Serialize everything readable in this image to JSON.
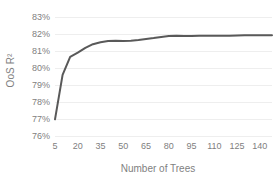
{
  "chart_data": {
    "type": "line",
    "title": "",
    "xlabel": "Number of Trees",
    "ylabel": "OoS R²",
    "xlim": [
      5,
      148
    ],
    "ylim": [
      0.76,
      0.83
    ],
    "ytick_format": "percent",
    "grid": true,
    "legend": "none",
    "series_color": "#595959",
    "gridline_color": "#eeeeee",
    "tick_label_color": "#808080",
    "axis_title_color": "#7f7f7f",
    "background": "#ffffff",
    "xticks": [
      5,
      20,
      35,
      50,
      65,
      80,
      95,
      110,
      125,
      140
    ],
    "xtick_labels": [
      "5",
      "20",
      "35",
      "50",
      "65",
      "80",
      "95",
      "110",
      "125",
      "140"
    ],
    "yticks": [
      0.76,
      0.77,
      0.78,
      0.79,
      0.8,
      0.81,
      0.82,
      0.83
    ],
    "ytick_labels": [
      "76%",
      "77%",
      "78%",
      "79%",
      "80%",
      "81%",
      "82%",
      "83%"
    ],
    "x": [
      5,
      10,
      15,
      20,
      25,
      30,
      35,
      40,
      45,
      50,
      55,
      60,
      65,
      70,
      75,
      80,
      85,
      90,
      95,
      100,
      105,
      110,
      115,
      120,
      125,
      130,
      135,
      140,
      145,
      148
    ],
    "values": [
      0.7698,
      0.796,
      0.8065,
      0.809,
      0.8118,
      0.814,
      0.8152,
      0.8159,
      0.816,
      0.8159,
      0.8161,
      0.8165,
      0.817,
      0.8176,
      0.8183,
      0.8188,
      0.8189,
      0.8188,
      0.8188,
      0.8189,
      0.8189,
      0.819,
      0.819,
      0.819,
      0.8191,
      0.8192,
      0.8192,
      0.8192,
      0.8193,
      0.8193
    ],
    "series_name": "OoS R² vs Number of Trees"
  }
}
